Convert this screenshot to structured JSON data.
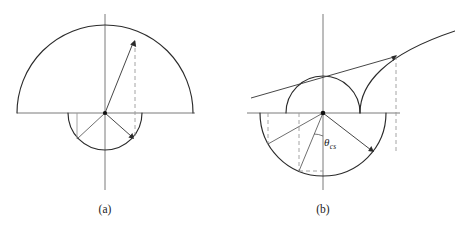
{
  "figure": {
    "background_color": "#ffffff",
    "line_color": "#2b2b2b",
    "axis_color": "#6b6b6b",
    "dashed_color": "#9a9a9a",
    "panels": [
      {
        "id": "a",
        "caption": "(a)",
        "caption_x": 105,
        "caption_y": 213,
        "origin": {
          "x": 105,
          "y": 113
        },
        "axes": {
          "horizontal": {
            "x1": 17,
            "y1": 113,
            "x2": 195,
            "y2": 113
          },
          "vertical": {
            "x1": 105,
            "y1": 14,
            "x2": 105,
            "y2": 190
          }
        },
        "upper_arc": {
          "radius": 88,
          "start_deg": 0,
          "end_deg": 180
        },
        "lower_arc": {
          "radius": 37,
          "start_deg": 180,
          "end_deg": 360
        },
        "vectors": [
          {
            "name": "upper-vector",
            "angle_deg": 70,
            "radius": 88,
            "tip_x": 135,
            "tip_y": 40
          },
          {
            "name": "lower-vector",
            "angle_deg": -40,
            "radius": 37,
            "tip_x": 133,
            "tip_y": 137
          },
          {
            "name": "lower-left-ray",
            "angle_deg": -140,
            "radius": 37,
            "tip_x": 77,
            "tip_y": 137
          }
        ],
        "projections": [
          {
            "name": "upper-dashed-projection",
            "x": 135,
            "y_top": 40,
            "y_bottom": 137,
            "style": "dashed"
          },
          {
            "name": "left-solid-projection",
            "x": 77,
            "y_top": 113,
            "y_bottom": 137,
            "style": "solid"
          }
        ]
      },
      {
        "id": "b",
        "caption": "(b)",
        "caption_x": 323,
        "caption_y": 213,
        "origin": {
          "x": 323,
          "y": 113
        },
        "axes": {
          "horizontal": {
            "x1": 247,
            "y1": 113,
            "x2": 400,
            "y2": 113
          },
          "vertical": {
            "x1": 323,
            "y1": 14,
            "x2": 323,
            "y2": 190
          }
        },
        "upper_arc": {
          "radius": 37,
          "start_deg": 0,
          "end_deg": 180
        },
        "lower_arc": {
          "radius": 63,
          "start_deg": 180,
          "end_deg": 360
        },
        "spiral": {
          "name": "outward-spiral-curve",
          "description": "curve rising from lower-right of small arc outward to upper right edge",
          "end_x": 455,
          "end_y": 32
        },
        "angle_label": {
          "symbol": "θ",
          "subscript": "cs",
          "x": 330,
          "y": 142
        },
        "angle_arc": {
          "radius": 23,
          "from_deg": -90,
          "to_deg": -62
        },
        "vectors": [
          {
            "name": "spiral-vector",
            "angle_deg": 38,
            "tip_x": 396,
            "tip_y": 55
          },
          {
            "name": "lower-right-vector",
            "angle_deg": -38,
            "radius": 63,
            "tip_x": 373,
            "tip_y": 152
          },
          {
            "name": "lower-left-ray",
            "angle_deg": -150,
            "radius": 63,
            "tip_x": 268,
            "tip_y": 144
          },
          {
            "name": "lower-steep-ray",
            "angle_deg": -112,
            "radius": 63,
            "tip_x": 299,
            "tip_y": 171
          }
        ],
        "projections": [
          {
            "name": "spiral-dashed-projection",
            "x": 396,
            "y_top": 55,
            "y_bottom": 152,
            "style": "dashed"
          },
          {
            "name": "left-dashed-projection",
            "x": 268,
            "y_top": 113,
            "y_bottom": 144,
            "style": "dashed"
          },
          {
            "name": "mid-dashed-projection",
            "x": 299,
            "y_top": 113,
            "y_bottom": 171,
            "style": "dashed"
          },
          {
            "name": "horizontal-dashed-projection",
            "x1": 299,
            "y1": 171,
            "x2": 323,
            "y2": 171,
            "style": "dashed"
          }
        ]
      }
    ]
  }
}
